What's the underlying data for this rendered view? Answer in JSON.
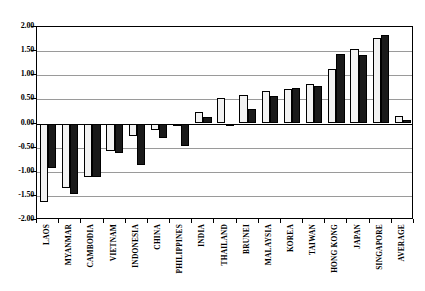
{
  "chart_data": {
    "type": "bar",
    "title": "",
    "subtitle": "",
    "xlabel": "",
    "ylabel": "",
    "ylim": [
      -2.0,
      2.0
    ],
    "ytick_step": 0.5,
    "ytick_labels": [
      "2.00",
      "1.50",
      "1.00",
      "0.50",
      "0.00",
      "-0.50",
      "-1.00",
      "-1.50",
      "-2.00"
    ],
    "ytick_values": [
      2.0,
      1.5,
      1.0,
      0.5,
      0.0,
      -0.5,
      -1.0,
      -1.5,
      -2.0
    ],
    "grid": true,
    "grid_axis": "y",
    "legend_position": "top-left-inside",
    "categories": [
      "LAOS",
      "MYANMAR",
      "CAMBODIA",
      "VIETNAM",
      "INDONESIA",
      "CHINA",
      "PHILIPPINES",
      "INDIA",
      "THAILAND",
      "BRUNEI",
      "MALAYSIA",
      "KOREA",
      "TAIWAN",
      "HONG KONG",
      "JAPAN",
      "SINGAPORE",
      "AVERAGE"
    ],
    "series": [
      {
        "name": "1996",
        "color": "#f2f2f2",
        "edge_color": "#000000",
        "values": [
          -1.63,
          -1.33,
          -1.1,
          -0.58,
          -0.25,
          -0.13,
          -0.06,
          0.24,
          0.52,
          0.6,
          0.67,
          0.72,
          0.81,
          1.13,
          1.54,
          1.77,
          0.16
        ]
      },
      {
        "name": "2006",
        "color": "#1a1a1a",
        "edge_color": "#000000",
        "values": [
          -0.92,
          -1.47,
          -1.1,
          -0.62,
          -0.85,
          -0.3,
          -0.46,
          0.13,
          -0.02,
          0.3,
          0.58,
          0.73,
          0.77,
          1.45,
          1.42,
          1.84,
          0.08
        ]
      }
    ]
  },
  "legend": {
    "items": [
      {
        "label": "1996",
        "swatch": "open-square"
      },
      {
        "label": "2006",
        "swatch": "filled-square"
      }
    ]
  },
  "colors": {
    "series_1996": "#f2f2f2",
    "series_2006": "#1a1a1a",
    "axis": "#000000",
    "gridline": "#9a9a9a",
    "background": "#ffffff"
  }
}
